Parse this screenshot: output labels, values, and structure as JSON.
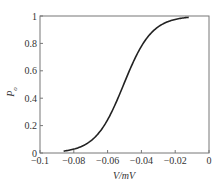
{
  "chart_data": {
    "type": "line",
    "title": "",
    "xlabel": "V/mV",
    "ylabel": "P_o",
    "xlim": [
      -0.1,
      0
    ],
    "ylim": [
      0,
      1
    ],
    "grid": false,
    "legend": null,
    "x_ticks": [
      "-0.1",
      "-0.08",
      "-0.06",
      "-0.04",
      "-0.02",
      "0"
    ],
    "y_ticks": [
      "0",
      "0.2",
      "0.4",
      "0.6",
      "0.8",
      "1"
    ],
    "series": [
      {
        "name": "P_o",
        "color": "#222222",
        "x": [
          -0.086,
          -0.08,
          -0.075,
          -0.07,
          -0.065,
          -0.06,
          -0.055,
          -0.05,
          -0.045,
          -0.04,
          -0.035,
          -0.03,
          -0.025,
          -0.02,
          -0.015,
          -0.012
        ],
        "y": [
          0.0,
          0.01,
          0.03,
          0.06,
          0.12,
          0.24,
          0.39,
          0.55,
          0.72,
          0.85,
          0.93,
          0.97,
          0.99,
          1.0,
          1.0,
          1.0
        ]
      }
    ]
  },
  "labels": {
    "x_axis": "V/mV",
    "y_axis_main": "P",
    "y_axis_sub": "o"
  }
}
